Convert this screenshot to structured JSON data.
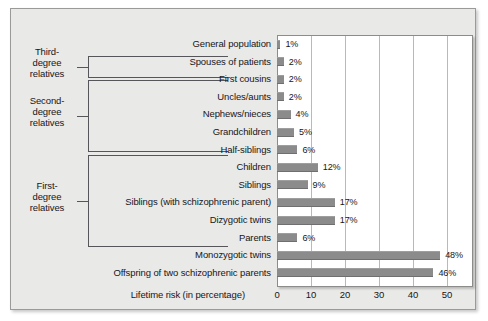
{
  "chart_data": {
    "type": "bar",
    "orientation": "horizontal",
    "title": "",
    "xlabel": "Lifetime risk (in percentage)",
    "ylabel": "",
    "xlim": [
      0,
      57
    ],
    "xticks": [
      0,
      10,
      20,
      30,
      40,
      50
    ],
    "xtick_labels": [
      "0",
      "10",
      "20",
      "30",
      "40",
      "50"
    ],
    "grid": true,
    "legend": "none",
    "bar_color": "#8b8b8b",
    "categories": [
      "General population",
      "Spouses of patients",
      "First cousins",
      "Uncles/aunts",
      "Nephews/nieces",
      "Grandchildren",
      "Half-siblings",
      "Children",
      "Siblings",
      "Siblings (with schizophrenic parent)",
      "Dizygotic twins",
      "Parents",
      "Monozygotic twins",
      "Offspring of two schizophrenic parents"
    ],
    "values": [
      1,
      2,
      2,
      2,
      4,
      5,
      6,
      12,
      9,
      17,
      17,
      6,
      48,
      46
    ],
    "value_labels": [
      "1%",
      "2%",
      "2%",
      "2%",
      "4%",
      "5%",
      "6%",
      "12%",
      "9%",
      "17%",
      "17%",
      "6%",
      "48%",
      "46%"
    ],
    "groups": [
      {
        "label_lines": [
          "Third-",
          "degree",
          "relatives"
        ],
        "first_index": 2,
        "last_index": 2
      },
      {
        "label_lines": [
          "Second-",
          "degree",
          "relatives"
        ],
        "first_index": 3,
        "last_index": 6
      },
      {
        "label_lines": [
          "First-",
          "degree",
          "relatives"
        ],
        "first_index": 7,
        "last_index": 11
      }
    ]
  }
}
